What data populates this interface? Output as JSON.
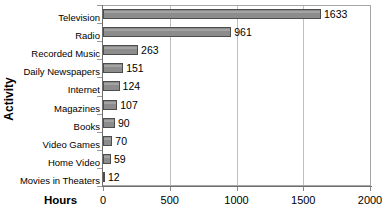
{
  "chart_data": {
    "type": "bar",
    "orientation": "horizontal",
    "title": "",
    "xlabel": "Hours",
    "ylabel": "Activity",
    "xlim": [
      0,
      2000
    ],
    "grid": true,
    "legend": false,
    "categories": [
      "Television",
      "Radio",
      "Recorded Music",
      "Daily Newspapers",
      "Internet",
      "Magazines",
      "Books",
      "Video Games",
      "Home Video",
      "Movies in Theaters"
    ],
    "values": [
      1633,
      961,
      263,
      151,
      124,
      107,
      90,
      70,
      59,
      12
    ],
    "value_labels": [
      "1633",
      "961",
      "263",
      "151",
      "124",
      "107",
      "90",
      "70",
      "59",
      "12"
    ],
    "xticks": [
      0,
      500,
      1000,
      1500,
      2000
    ],
    "xtick_labels": [
      "0",
      "500",
      "1000",
      "1500",
      "2000"
    ],
    "bar_color": "#8c8c8c",
    "bar_border_color": "#4d4d4d",
    "gridline_color": "#bfbfbf",
    "axis_color": "#6e6e6e",
    "plot_border_color": "#a6a6a6"
  }
}
